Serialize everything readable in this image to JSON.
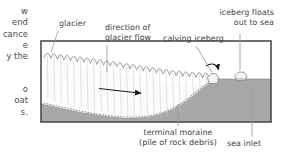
{
  "page": {
    "background": "#ffffff",
    "text_color": "#3f3f3f"
  },
  "margin_text": {
    "paragraph_a": "w\nend\ncance\ne\ny the",
    "paragraph_b": "o\noat\ns."
  },
  "diagram": {
    "title_labels": {
      "glacier": "glacier",
      "direction_of_glacier_flow": "direction of\nglacier flow",
      "calving_iceberg": "calving iceberg",
      "iceberg_floats_out_to_sea": "iceberg floats\nout to sea",
      "terminal_moraine": "terminal moraine\n(pile of rock debris)",
      "sea_inlet": "sea inlet"
    },
    "colors": {
      "frame_border": "#4d4d4d",
      "bedrock_fill": "#a8a8a8",
      "sea_fill": "#9a9a9a",
      "glacier_fill": "#fbfbfb",
      "glacier_line": "#7a7a7a",
      "iceberg_fill": "#f2f2f2",
      "leader_line": "#8a8a8a",
      "arrow": "#1a1a1a",
      "moraine_dots": "#8f8f8f"
    },
    "frame": {
      "left": 41,
      "top": 41,
      "right": 271,
      "bottom": 122
    },
    "icebergs": [
      {
        "name": "calving-iceberg",
        "cx": 215,
        "cy": 79
      },
      {
        "name": "floating-iceberg",
        "cx": 243,
        "cy": 76
      }
    ],
    "flow_arrow": {
      "x1": 99,
      "y1": 89,
      "x2": 142,
      "y2": 93
    },
    "calving_arrow_label": "curved calving arrow"
  }
}
